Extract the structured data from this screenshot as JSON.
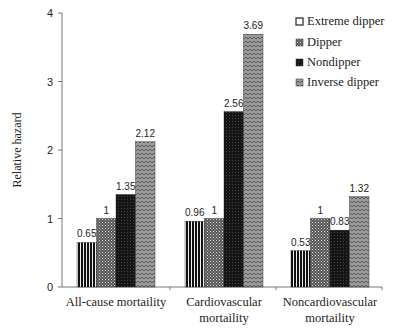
{
  "chart_data": {
    "type": "bar",
    "title": "",
    "xlabel": "",
    "ylabel": "Relative hazard",
    "ylim": [
      0,
      4
    ],
    "yticks": [
      0,
      1,
      2,
      3,
      4
    ],
    "grid": false,
    "legend_position": "top-right",
    "categories": [
      [
        "All-cause mortaility"
      ],
      [
        "Cardiovascular",
        "mortaility"
      ],
      [
        "Noncardiovascular",
        "mortaility"
      ]
    ],
    "series": [
      {
        "name": "Extreme dipper",
        "values": [
          0.65,
          0.96,
          0.53
        ],
        "labels": [
          "0.65",
          "0.96",
          "0.53"
        ],
        "pattern": "vertical-stripes"
      },
      {
        "name": "Dipper",
        "values": [
          1,
          1,
          1
        ],
        "labels": [
          "1",
          "1",
          "1"
        ],
        "pattern": "crosshatch"
      },
      {
        "name": "Nondipper",
        "values": [
          1.35,
          2.56,
          0.83
        ],
        "labels": [
          "1.35",
          "2.56",
          "0.83"
        ],
        "pattern": "dense-dark"
      },
      {
        "name": "Inverse dipper",
        "values": [
          2.12,
          3.69,
          1.32
        ],
        "labels": [
          "2.12",
          "3.69",
          "1.32"
        ],
        "pattern": "zigzag-gray"
      }
    ]
  }
}
